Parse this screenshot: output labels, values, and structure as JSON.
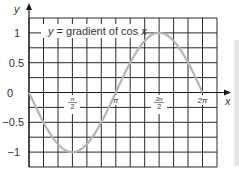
{
  "chart_data": {
    "type": "line",
    "title": "",
    "annotation": "y = gradient of cos x",
    "xlabel": "x",
    "ylabel": "y",
    "x_ticks": [
      "π/2",
      "π",
      "3π/2",
      "2π"
    ],
    "y_ticks": [
      "1",
      "0.5",
      "0",
      "−0.5",
      "−1"
    ],
    "xlim": [
      0,
      6.8
    ],
    "ylim": [
      -1.25,
      1.25
    ],
    "grid": true,
    "series": [
      {
        "name": "y = gradient of cos x (−sin x)",
        "color": "#b5b5b5",
        "x": [
          0,
          0.785,
          1.571,
          2.356,
          3.142,
          3.927,
          4.712,
          5.498,
          6.283
        ],
        "values": [
          0,
          -0.707,
          -1,
          -0.707,
          0,
          0.707,
          1,
          0.707,
          0
        ]
      }
    ]
  },
  "labels": {
    "y_axis": "y",
    "x_axis": "x",
    "curve": "y = gradient of cos x",
    "y1": "1",
    "y05": "0.5",
    "y0": "0",
    "ym05": "−0.5",
    "ym1": "−1",
    "pi": "π",
    "two_pi": "2π",
    "half_num": "π",
    "half_den": "2",
    "three_half_num": "3π",
    "three_half_den": "2"
  }
}
